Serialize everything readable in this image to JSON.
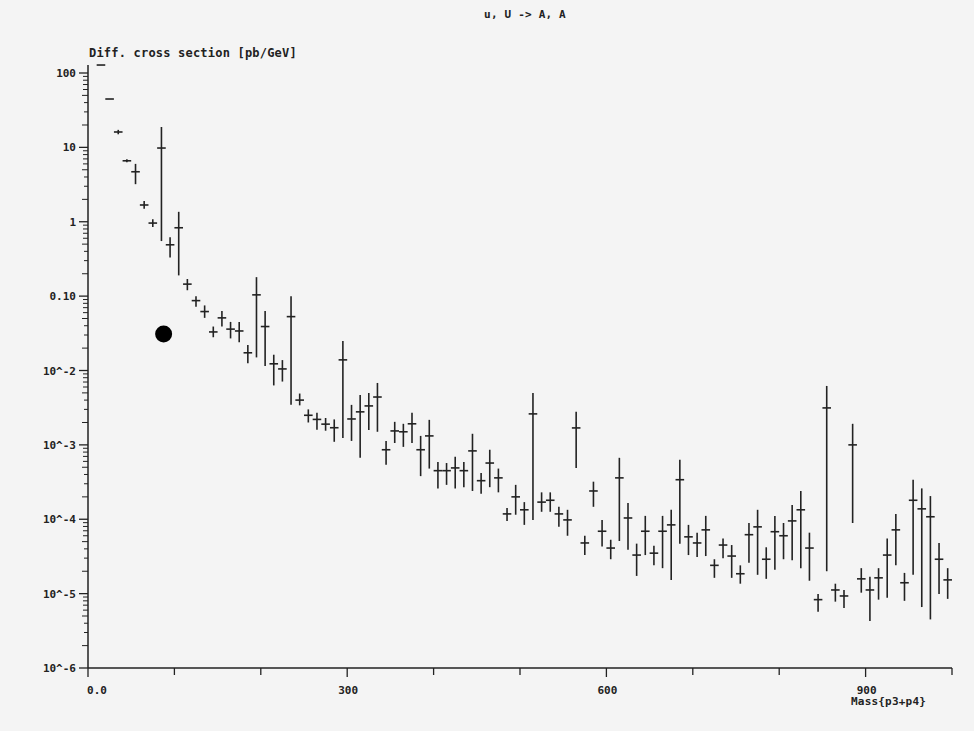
{
  "plot": {
    "title": "u, U -> A, A",
    "y_title": "Diff. cross section [pb/GeV]",
    "x_title": "Mass{p3+p4}"
  },
  "colors": {
    "background": "#f4f4f4",
    "ink": "#222222",
    "marker": "#000000"
  },
  "chart_data": {
    "type": "scatter",
    "title": "u, U -> A, A",
    "xlabel": "Mass{p3+p4}",
    "ylabel": "Diff. cross section [pb/GeV]",
    "xlim": [
      0,
      1000
    ],
    "ylim": [
      1e-06,
      100
    ],
    "yscale": "log",
    "grid": false,
    "legend": null,
    "x_ticks": [
      {
        "value": 0,
        "label": "0.0"
      },
      {
        "value": 100,
        "label": ""
      },
      {
        "value": 200,
        "label": ""
      },
      {
        "value": 300,
        "label": "300"
      },
      {
        "value": 400,
        "label": ""
      },
      {
        "value": 500,
        "label": ""
      },
      {
        "value": 600,
        "label": "600"
      },
      {
        "value": 700,
        "label": ""
      },
      {
        "value": 800,
        "label": ""
      },
      {
        "value": 900,
        "label": "900"
      },
      {
        "value": 1000,
        "label": ""
      }
    ],
    "y_ticks": [
      {
        "value": 100,
        "label": "100"
      },
      {
        "value": 10,
        "label": "10"
      },
      {
        "value": 1,
        "label": "1"
      },
      {
        "value": 0.1,
        "label": "0.10"
      },
      {
        "value": 0.01,
        "label": "10^-2"
      },
      {
        "value": 0.001,
        "label": "10^-3"
      },
      {
        "value": 0.0001,
        "label": "10^-4"
      },
      {
        "value": 1e-05,
        "label": "10^-5"
      },
      {
        "value": 1e-06,
        "label": "10^-6"
      }
    ],
    "bin_width": 10,
    "series": [
      {
        "name": "MC histogram (value, error low, error high)",
        "style": "crosses with vertical error bars",
        "points": [
          {
            "x": 15,
            "y": 128,
            "lo": 128,
            "hi": 128
          },
          {
            "x": 25,
            "y": 44.7,
            "lo": 44.7,
            "hi": 44.7
          },
          {
            "x": 35,
            "y": 16.1,
            "lo": 15.0,
            "hi": 17.2
          },
          {
            "x": 45,
            "y": 6.6,
            "lo": 6.3,
            "hi": 6.9
          },
          {
            "x": 55,
            "y": 4.7,
            "lo": 3.2,
            "hi": 6.0
          },
          {
            "x": 65,
            "y": 1.68,
            "lo": 1.5,
            "hi": 1.9
          },
          {
            "x": 75,
            "y": 0.96,
            "lo": 0.85,
            "hi": 1.08
          },
          {
            "x": 85,
            "y": 9.8,
            "lo": 0.55,
            "hi": 18.8
          },
          {
            "x": 95,
            "y": 0.49,
            "lo": 0.33,
            "hi": 0.62
          },
          {
            "x": 105,
            "y": 0.83,
            "lo": 0.19,
            "hi": 1.36
          },
          {
            "x": 115,
            "y": 0.145,
            "lo": 0.12,
            "hi": 0.17
          },
          {
            "x": 125,
            "y": 0.087,
            "lo": 0.072,
            "hi": 0.1
          },
          {
            "x": 135,
            "y": 0.062,
            "lo": 0.051,
            "hi": 0.075
          },
          {
            "x": 145,
            "y": 0.033,
            "lo": 0.028,
            "hi": 0.039
          },
          {
            "x": 155,
            "y": 0.051,
            "lo": 0.039,
            "hi": 0.063
          },
          {
            "x": 165,
            "y": 0.036,
            "lo": 0.027,
            "hi": 0.045
          },
          {
            "x": 175,
            "y": 0.034,
            "lo": 0.024,
            "hi": 0.045
          },
          {
            "x": 185,
            "y": 0.0173,
            "lo": 0.0125,
            "hi": 0.022
          },
          {
            "x": 195,
            "y": 0.104,
            "lo": 0.015,
            "hi": 0.18
          },
          {
            "x": 205,
            "y": 0.039,
            "lo": 0.0115,
            "hi": 0.063
          },
          {
            "x": 215,
            "y": 0.0123,
            "lo": 0.0063,
            "hi": 0.0163
          },
          {
            "x": 225,
            "y": 0.0105,
            "lo": 0.0071,
            "hi": 0.0138
          },
          {
            "x": 235,
            "y": 0.053,
            "lo": 0.00345,
            "hi": 0.1
          },
          {
            "x": 245,
            "y": 0.004,
            "lo": 0.0034,
            "hi": 0.0049
          },
          {
            "x": 255,
            "y": 0.0025,
            "lo": 0.002,
            "hi": 0.003
          },
          {
            "x": 265,
            "y": 0.0022,
            "lo": 0.0016,
            "hi": 0.0027
          },
          {
            "x": 275,
            "y": 0.0019,
            "lo": 0.00155,
            "hi": 0.0023
          },
          {
            "x": 285,
            "y": 0.0017,
            "lo": 0.0011,
            "hi": 0.0022
          },
          {
            "x": 295,
            "y": 0.0139,
            "lo": 0.00124,
            "hi": 0.025
          },
          {
            "x": 305,
            "y": 0.00223,
            "lo": 0.00113,
            "hi": 0.00345
          },
          {
            "x": 315,
            "y": 0.00278,
            "lo": 0.00067,
            "hi": 0.0047
          },
          {
            "x": 325,
            "y": 0.00334,
            "lo": 0.00159,
            "hi": 0.005
          },
          {
            "x": 335,
            "y": 0.0044,
            "lo": 0.0015,
            "hi": 0.0068
          },
          {
            "x": 345,
            "y": 0.00086,
            "lo": 0.00054,
            "hi": 0.00113
          },
          {
            "x": 355,
            "y": 0.00154,
            "lo": 0.00106,
            "hi": 0.00204
          },
          {
            "x": 365,
            "y": 0.0015,
            "lo": 0.00094,
            "hi": 0.00192
          },
          {
            "x": 375,
            "y": 0.00192,
            "lo": 0.00106,
            "hi": 0.0027
          },
          {
            "x": 385,
            "y": 0.00086,
            "lo": 0.00038,
            "hi": 0.00132
          },
          {
            "x": 395,
            "y": 0.00132,
            "lo": 0.00048,
            "hi": 0.00217
          },
          {
            "x": 405,
            "y": 0.00045,
            "lo": 0.00026,
            "hi": 0.00059
          },
          {
            "x": 415,
            "y": 0.00045,
            "lo": 0.00029,
            "hi": 0.00057
          },
          {
            "x": 425,
            "y": 0.00049,
            "lo": 0.00026,
            "hi": 0.00069
          },
          {
            "x": 435,
            "y": 0.00045,
            "lo": 0.00027,
            "hi": 0.00059
          },
          {
            "x": 445,
            "y": 0.00083,
            "lo": 0.00024,
            "hi": 0.00141
          },
          {
            "x": 455,
            "y": 0.00033,
            "lo": 0.00022,
            "hi": 0.00042
          },
          {
            "x": 465,
            "y": 0.00057,
            "lo": 0.00027,
            "hi": 0.00086
          },
          {
            "x": 475,
            "y": 0.00036,
            "lo": 0.00023,
            "hi": 0.00048
          },
          {
            "x": 485,
            "y": 0.000118,
            "lo": 9.5e-05,
            "hi": 0.000142
          },
          {
            "x": 495,
            "y": 0.0002,
            "lo": 0.000115,
            "hi": 0.00029
          },
          {
            "x": 505,
            "y": 0.000134,
            "lo": 8.4e-05,
            "hi": 0.00017
          },
          {
            "x": 515,
            "y": 0.00261,
            "lo": 9.8e-05,
            "hi": 0.005
          },
          {
            "x": 525,
            "y": 0.00017,
            "lo": 0.000126,
            "hi": 0.00023
          },
          {
            "x": 535,
            "y": 0.00018,
            "lo": 0.000126,
            "hi": 0.00023
          },
          {
            "x": 545,
            "y": 0.000118,
            "lo": 7.9e-05,
            "hi": 0.000147
          },
          {
            "x": 555,
            "y": 9.8e-05,
            "lo": 6e-05,
            "hi": 0.000134
          },
          {
            "x": 565,
            "y": 0.00169,
            "lo": 0.00049,
            "hi": 0.00278
          },
          {
            "x": 575,
            "y": 4.8e-05,
            "lo": 3.3e-05,
            "hi": 6e-05
          },
          {
            "x": 585,
            "y": 0.00024,
            "lo": 0.000147,
            "hi": 0.00032
          },
          {
            "x": 595,
            "y": 6.9e-05,
            "lo": 4.3e-05,
            "hi": 9.8e-05
          },
          {
            "x": 605,
            "y": 4.1e-05,
            "lo": 2.9e-05,
            "hi": 5.3e-05
          },
          {
            "x": 615,
            "y": 0.00036,
            "lo": 5.1e-05,
            "hi": 0.00067
          },
          {
            "x": 625,
            "y": 0.000104,
            "lo": 3.9e-05,
            "hi": 0.000166
          },
          {
            "x": 635,
            "y": 3.3e-05,
            "lo": 1.73e-05,
            "hi": 4.7e-05
          },
          {
            "x": 645,
            "y": 6.9e-05,
            "lo": 3.3e-05,
            "hi": 0.000111
          },
          {
            "x": 655,
            "y": 3.5e-05,
            "lo": 2.4e-05,
            "hi": 4.4e-05
          },
          {
            "x": 665,
            "y": 6.9e-05,
            "lo": 2.2e-05,
            "hi": 0.000111
          },
          {
            "x": 675,
            "y": 8.4e-05,
            "lo": 1.53e-05,
            "hi": 0.000134
          },
          {
            "x": 685,
            "y": 0.00034,
            "lo": 4.7e-05,
            "hi": 0.00063
          },
          {
            "x": 695,
            "y": 5.8e-05,
            "lo": 3.3e-05,
            "hi": 8.4e-05
          },
          {
            "x": 705,
            "y": 4.8e-05,
            "lo": 3.1e-05,
            "hi": 6.6e-05
          },
          {
            "x": 715,
            "y": 7.2e-05,
            "lo": 3.2e-05,
            "hi": 0.000111
          },
          {
            "x": 725,
            "y": 2.4e-05,
            "lo": 1.63e-05,
            "hi": 2.9e-05
          },
          {
            "x": 735,
            "y": 4.5e-05,
            "lo": 3e-05,
            "hi": 5.5e-05
          },
          {
            "x": 745,
            "y": 3.2e-05,
            "lo": 1.63e-05,
            "hi": 4.5e-05
          },
          {
            "x": 755,
            "y": 1.85e-05,
            "lo": 1.36e-05,
            "hi": 2.4e-05
          },
          {
            "x": 765,
            "y": 6.2e-05,
            "lo": 2.6e-05,
            "hi": 8.9e-05
          },
          {
            "x": 775,
            "y": 7.9e-05,
            "lo": 1.79e-05,
            "hi": 0.000134
          },
          {
            "x": 785,
            "y": 2.9e-05,
            "lo": 1.58e-05,
            "hi": 4.2e-05
          },
          {
            "x": 795,
            "y": 6.8e-05,
            "lo": 2.1e-05,
            "hi": 0.000111
          },
          {
            "x": 805,
            "y": 6e-05,
            "lo": 2.9e-05,
            "hi": 8.9e-05
          },
          {
            "x": 815,
            "y": 9.5e-05,
            "lo": 2.8e-05,
            "hi": 0.000156
          },
          {
            "x": 825,
            "y": 0.000134,
            "lo": 2.2e-05,
            "hi": 0.00024
          },
          {
            "x": 835,
            "y": 4.1e-05,
            "lo": 1.49e-05,
            "hi": 6.6e-05
          },
          {
            "x": 845,
            "y": 8.3e-06,
            "lo": 5.7e-06,
            "hi": 9.9e-06
          },
          {
            "x": 855,
            "y": 0.00314,
            "lo": 2e-05,
            "hi": 0.0062
          },
          {
            "x": 865,
            "y": 1.12e-05,
            "lo": 7.8e-06,
            "hi": 1.36e-05
          },
          {
            "x": 875,
            "y": 9.3e-06,
            "lo": 6.4e-06,
            "hi": 1.12e-05
          },
          {
            "x": 885,
            "y": 0.001,
            "lo": 8.9e-05,
            "hi": 0.00192
          },
          {
            "x": 895,
            "y": 1.58e-05,
            "lo": 1.03e-05,
            "hi": 2.2e-05
          },
          {
            "x": 905,
            "y": 1.12e-05,
            "lo": 4.3e-06,
            "hi": 1.69e-05
          },
          {
            "x": 915,
            "y": 1.63e-05,
            "lo": 8.3e-06,
            "hi": 2.2e-05
          },
          {
            "x": 925,
            "y": 3.3e-05,
            "lo": 8.8e-06,
            "hi": 5.5e-05
          },
          {
            "x": 935,
            "y": 7.2e-05,
            "lo": 2.4e-05,
            "hi": 0.000118
          },
          {
            "x": 945,
            "y": 1.4e-05,
            "lo": 8e-06,
            "hi": 1.9e-05
          },
          {
            "x": 955,
            "y": 0.00018,
            "lo": 1.79e-05,
            "hi": 0.00034
          },
          {
            "x": 965,
            "y": 0.000138,
            "lo": 6.6e-06,
            "hi": 0.00026
          },
          {
            "x": 975,
            "y": 0.000108,
            "lo": 4.5e-06,
            "hi": 0.000205
          },
          {
            "x": 985,
            "y": 2.9e-05,
            "lo": 9.9e-06,
            "hi": 4.8e-05
          },
          {
            "x": 995,
            "y": 1.53e-05,
            "lo": 8.5e-06,
            "hi": 2.2e-05
          }
        ]
      },
      {
        "name": "marker",
        "style": "filled circle",
        "points": [
          {
            "x": 91,
            "y": 0.031
          }
        ]
      }
    ]
  }
}
